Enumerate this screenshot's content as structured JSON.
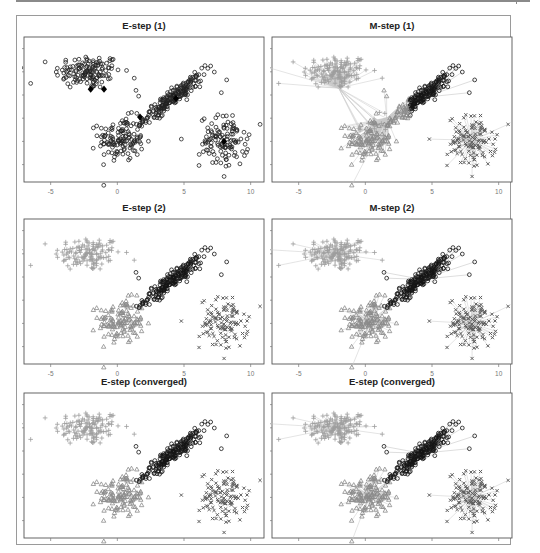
{
  "figure": {
    "layout": "3 rows x 2 columns of scatter plots",
    "panels": [
      {
        "id": "e1",
        "title": "E-step (1)",
        "kind": "e",
        "assign": "none",
        "row": 0,
        "col": 0
      },
      {
        "id": "m1",
        "title": "M-step (1)",
        "kind": "m",
        "assign": "m1",
        "row": 0,
        "col": 1
      },
      {
        "id": "e2",
        "title": "E-step (2)",
        "kind": "e",
        "assign": "full",
        "row": 1,
        "col": 0
      },
      {
        "id": "m2",
        "title": "M-step (2)",
        "kind": "m",
        "assign": "full",
        "row": 1,
        "col": 1
      },
      {
        "id": "e3",
        "title": "E-step (converged)",
        "kind": "e",
        "assign": "full",
        "row": 2,
        "col": 0
      },
      {
        "id": "m3",
        "title": "E-step (converged)",
        "kind": "m",
        "assign": "full",
        "row": 2,
        "col": 1
      }
    ],
    "below_labels": [
      "E-step (2)",
      "M-step (2)",
      "E-step (converged)",
      "E-step (converged)"
    ]
  },
  "chart_data": {
    "type": "scatter",
    "xlabel": "",
    "ylabel": "",
    "xlim": [
      -7,
      11
    ],
    "ylim": [
      -3.5,
      9
    ],
    "x_ticks": [
      -5,
      0,
      5,
      10
    ],
    "x_tick_labels": [
      "-5",
      "0",
      "5",
      "10"
    ],
    "y_ticks": [
      -2,
      0,
      2,
      4,
      6,
      8
    ],
    "y_tick_labels": [
      "-2",
      "0",
      "2",
      "4",
      "6",
      "8"
    ],
    "grid": false,
    "legend": null,
    "clusters": [
      {
        "name": "upper-left",
        "marker": "plus",
        "color": "#9a9a9a",
        "center": [
          -2.2,
          6.0
        ],
        "sd": [
          1.25,
          0.75
        ],
        "rho": 0.0,
        "n": 140
      },
      {
        "name": "lower-left",
        "marker": "triangle",
        "color": "#8c8c8c",
        "center": [
          0.3,
          0.2
        ],
        "sd": [
          0.85,
          0.95
        ],
        "rho": 0.0,
        "n": 130
      },
      {
        "name": "diagonal",
        "marker": "circle",
        "color": "#111111",
        "center": [
          4.2,
          3.8
        ],
        "sd": [
          1.1,
          1.0
        ],
        "rho": 0.93,
        "n": 200
      },
      {
        "name": "right",
        "marker": "x",
        "color": "#666666",
        "center": [
          8.0,
          0.0
        ],
        "sd": [
          0.9,
          1.1
        ],
        "rho": 0.0,
        "n": 120
      }
    ],
    "panels": [
      {
        "title": "E-step (1)",
        "means": [
          [
            -2.0,
            4.5
          ],
          [
            -1.0,
            4.5
          ],
          [
            1.7,
            2.1
          ],
          [
            4.4,
            3.7
          ],
          [
            8.0,
            0.0
          ]
        ],
        "note": "all points open circles, initial means shown as filled diamonds"
      },
      {
        "title": "M-step (1)",
        "means": [
          [
            -2.0,
            4.6
          ],
          [
            1.6,
            2.0
          ],
          [
            4.4,
            3.8
          ],
          [
            8.0,
            0.1
          ]
        ],
        "note": "lines from points to assigned component means"
      },
      {
        "title": "E-step (2)",
        "note": "points colored/shaped by assignment"
      },
      {
        "title": "M-step (2)",
        "means": [
          [
            -2.2,
            6.0
          ],
          [
            0.4,
            0.2
          ],
          [
            4.2,
            3.8
          ],
          [
            8.0,
            0.0
          ]
        ]
      },
      {
        "title": "E-step (converged)",
        "note": "final assignment"
      },
      {
        "title": "E-step (converged)",
        "means": [
          [
            -2.2,
            6.0
          ],
          [
            0.3,
            0.2
          ],
          [
            4.2,
            3.8
          ],
          [
            8.0,
            0.0
          ]
        ],
        "note": "lines from points to converged means"
      }
    ]
  }
}
